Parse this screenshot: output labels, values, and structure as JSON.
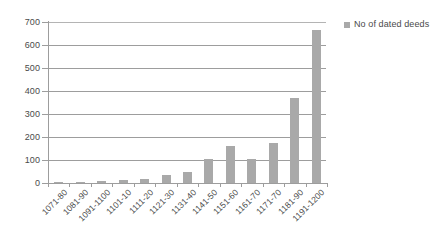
{
  "chart_data": {
    "type": "bar",
    "title": "",
    "xlabel": "",
    "ylabel": "",
    "categories": [
      "1071-80",
      "1081-90",
      "1091-1100",
      "1101-10",
      "1111-20",
      "1121-30",
      "1131-40",
      "1141-50",
      "1151-60",
      "1161-70",
      "1171-70",
      "1181-90",
      "1191-1200"
    ],
    "series": [
      {
        "name": "No of dated deeds",
        "values": [
          3,
          6,
          7,
          11,
          19,
          34,
          48,
          103,
          160,
          105,
          175,
          370,
          665
        ],
        "color": "#a9a9a9"
      }
    ],
    "ylim": [
      0,
      700
    ],
    "ytick_values": [
      0,
      100,
      200,
      300,
      400,
      500,
      600,
      700
    ],
    "ytick_labels": [
      "0",
      "100",
      "200",
      "300",
      "400",
      "500",
      "600",
      "700"
    ],
    "grid": true,
    "grid_axis": "y",
    "legend": {
      "position": "top-right",
      "entries": [
        {
          "label": "No of dated deeds",
          "color": "#a9a9a9",
          "marker": "square"
        }
      ]
    },
    "xtick_rotation": -45,
    "plot_background": "#ffffff",
    "gridline_color": "#9d9d9d",
    "axis_color": "#9d9d9d",
    "text_color": "#4a4a4a"
  }
}
